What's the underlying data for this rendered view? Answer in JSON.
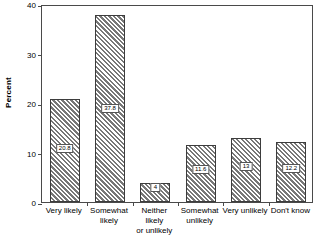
{
  "chart_data": {
    "type": "bar",
    "title": "",
    "xlabel": "",
    "ylabel": "Percent",
    "ylim": [
      0,
      40
    ],
    "yticks": [
      0,
      10,
      20,
      30,
      40
    ],
    "ytick_labels": [
      "0",
      "10",
      "20",
      "30",
      "40"
    ],
    "grid": false,
    "legend": false,
    "categories": [
      "Very likely",
      "Somewhat\nlikely",
      "Neither likely\nor unlikely",
      "Somewhat\nunlikely",
      "Very unlikely",
      "Don't know"
    ],
    "values": [
      20.8,
      37.8,
      3.8,
      11.6,
      13,
      12.2
    ],
    "value_labels": [
      "20.8",
      "37.8",
      "4",
      "11.6",
      "13",
      "12.2"
    ],
    "bar_style": {
      "fill": "#d8d8d8",
      "hatch": "diagonal-crosshatch",
      "edge_color": "#3d3d3d"
    }
  }
}
